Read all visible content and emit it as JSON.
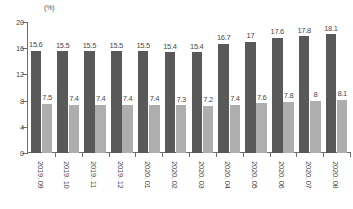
{
  "chart_data": {
    "type": "bar",
    "title": "",
    "subtitle": "",
    "unit_label": "(%)",
    "xlabel": "",
    "ylabel": "",
    "ylim": [
      0,
      20
    ],
    "y_ticks": [
      0,
      4,
      8,
      12,
      16,
      20
    ],
    "grid": false,
    "legend": "none",
    "orientation": "vertical",
    "grouping": "grouped",
    "categories": [
      "2019. 09",
      "2019. 10",
      "2019. 11",
      "2019. 12",
      "2020. 01",
      "2020. 02",
      "2020. 03",
      "2020. 04",
      "2020. 05",
      "2020. 06",
      "2020. 07",
      "2020. 08"
    ],
    "series": [
      {
        "name": "series-dark",
        "color": "#595959",
        "values": [
          15.6,
          15.5,
          15.5,
          15.5,
          15.5,
          15.4,
          15.4,
          16.7,
          17,
          17.6,
          17.8,
          18.1
        ],
        "labels": [
          "15.6",
          "15.5",
          "15.5",
          "15.5",
          "15.5",
          "15.4",
          "15.4",
          "16.7",
          "17",
          "17.6",
          "17.8",
          "18.1"
        ]
      },
      {
        "name": "series-light",
        "color": "#aeaeae",
        "values": [
          7.5,
          7.4,
          7.4,
          7.4,
          7.4,
          7.3,
          7.2,
          7.4,
          7.6,
          7.8,
          8,
          8.1
        ],
        "labels": [
          "7.5",
          "7.4",
          "7.4",
          "7.4",
          "7.4",
          "7.3",
          "7.2",
          "7.4",
          "7.6",
          "7.8",
          "8",
          "8.1"
        ]
      }
    ]
  }
}
